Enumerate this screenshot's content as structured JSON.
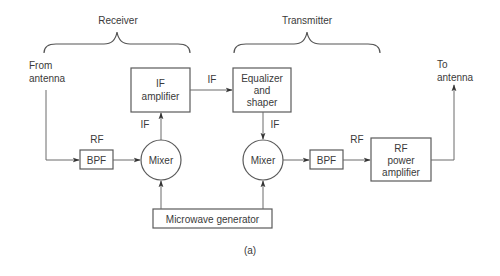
{
  "diagram": {
    "groups": {
      "receiver": "Receiver",
      "transmitter": "Transmitter"
    },
    "io": {
      "input_line1": "From",
      "input_line2": "antenna",
      "output_line1": "To",
      "output_line2": "antenna"
    },
    "blocks": {
      "bpf_rx": "BPF",
      "mixer_rx": "Mixer",
      "if_amplifier_line1": "IF",
      "if_amplifier_line2": "amplifier",
      "equalizer_line1": "Equalizer",
      "equalizer_line2": "and",
      "equalizer_line3": "shaper",
      "mixer_tx": "Mixer",
      "bpf_tx": "BPF",
      "rf_amp_line1": "RF",
      "rf_amp_line2": "power",
      "rf_amp_line3": "amplifier",
      "microwave_generator": "Microwave generator"
    },
    "signal_labels": {
      "rf_in": "RF",
      "if_up": "IF",
      "if_across": "IF",
      "if_down": "IF",
      "rf_out": "RF"
    },
    "caption": "(a)"
  }
}
